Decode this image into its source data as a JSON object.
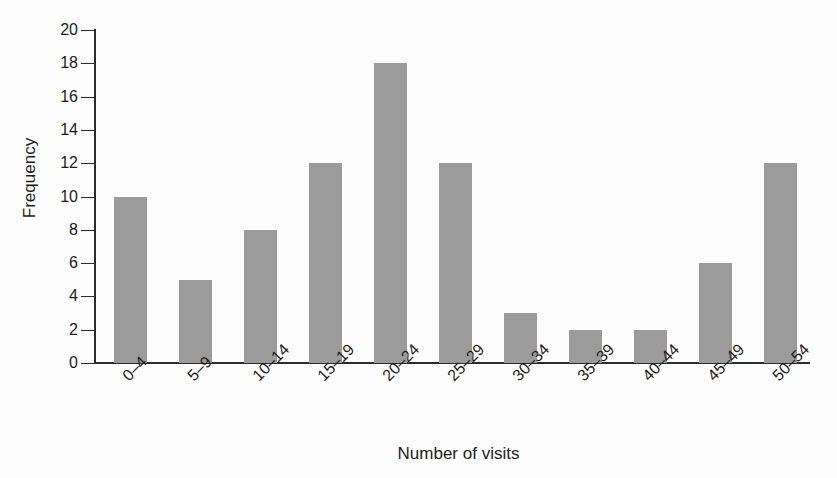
{
  "chart_data": {
    "type": "bar",
    "title": "",
    "subtitle": "",
    "xlabel": "Number of visits",
    "ylabel": "Frequency",
    "categories": [
      "0–4",
      "5–9",
      "10–14",
      "15–19",
      "20–24",
      "25–29",
      "30–34",
      "35–39",
      "40–44",
      "45–49",
      "50–54"
    ],
    "values": [
      10,
      5,
      8,
      12,
      18,
      12,
      3,
      2,
      2,
      6,
      12
    ],
    "ylim": [
      0,
      20
    ],
    "ytick_step": 2,
    "yticks": [
      0,
      2,
      4,
      6,
      8,
      10,
      12,
      14,
      16,
      18,
      20
    ],
    "ytick_labels": [
      "0",
      "2",
      "4",
      "6",
      "8",
      "10",
      "12",
      "14",
      "16",
      "18",
      "20"
    ],
    "grid": false,
    "legend": false,
    "legend_position": "none",
    "bar_color": "#9b9b9b",
    "axis_color": "#2b2b2b",
    "background_color": "#fdfdfd",
    "xtick_rotation": -45
  }
}
